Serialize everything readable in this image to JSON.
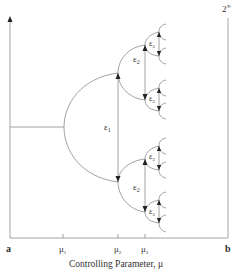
{
  "diagram": {
    "type": "bifurcation-diagram",
    "corner_label": "2",
    "corner_label_sup": "∞",
    "x_axis": {
      "label": "Controlling Parameter, μ",
      "start_label": "a",
      "end_label": "b",
      "ticks": [
        {
          "base": "μ",
          "sub": "1",
          "x": 63
        },
        {
          "base": "μ",
          "sub": "2",
          "x": 118
        },
        {
          "base": "μ",
          "sub": "3",
          "x": 145
        }
      ]
    },
    "epsilon_labels": [
      {
        "base": "ε",
        "sub": "1",
        "x": 104,
        "y": 130
      },
      {
        "base": "ε",
        "sub": "2",
        "x": 133,
        "y": 62
      },
      {
        "base": "ε",
        "sub": "3",
        "x": 149,
        "y": 46
      },
      {
        "base": "ε",
        "sub": "3",
        "x": 149,
        "y": 101
      },
      {
        "base": "ε",
        "sub": "2",
        "x": 133,
        "y": 190
      },
      {
        "base": "ε",
        "sub": "3",
        "x": 149,
        "y": 159
      },
      {
        "base": "ε",
        "sub": "3",
        "x": 149,
        "y": 214
      }
    ]
  }
}
